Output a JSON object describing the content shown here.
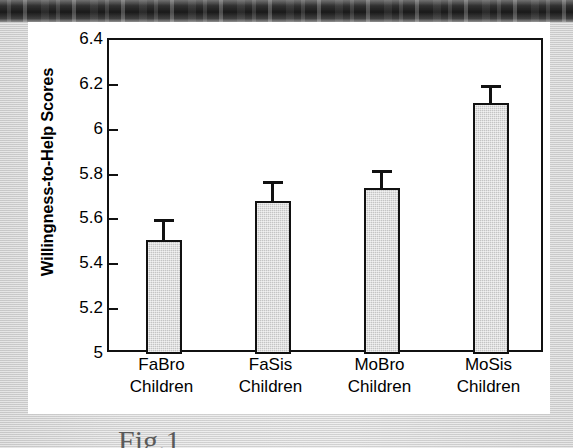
{
  "figure": {
    "caption_remnant": "Fig.1"
  },
  "chart_data": {
    "type": "bar",
    "title": "",
    "xlabel": "",
    "ylabel": "Willingness-to-Help Scores",
    "ylim": [
      5,
      6.4
    ],
    "ytick_labels": [
      "6.4",
      "6.2",
      "6",
      "5.8",
      "5.6",
      "5.4",
      "5.2",
      "5"
    ],
    "ytick_values": [
      6.4,
      6.2,
      6.0,
      5.8,
      5.6,
      5.4,
      5.2,
      5.0
    ],
    "grid": false,
    "legend": null,
    "categories": [
      "FaBro Children",
      "FaSis Children",
      "MoBro Children",
      "MoSis Children"
    ],
    "category_lines": [
      {
        "line1": "FaBro",
        "line2": "Children"
      },
      {
        "line1": "FaSis",
        "line2": "Children"
      },
      {
        "line1": "MoBro",
        "line2": "Children"
      },
      {
        "line1": "MoSis",
        "line2": "Children"
      }
    ],
    "values": [
      5.51,
      5.68,
      5.74,
      6.12
    ],
    "error_upper": [
      5.6,
      5.77,
      5.82,
      6.2
    ],
    "error_bar_lengths": [
      0.09,
      0.09,
      0.08,
      0.08
    ],
    "bar_fill_color": "#c4c4c4",
    "bar_edge_color": "#111111",
    "axis_color": "#111111",
    "background_color": "#ffffff"
  }
}
